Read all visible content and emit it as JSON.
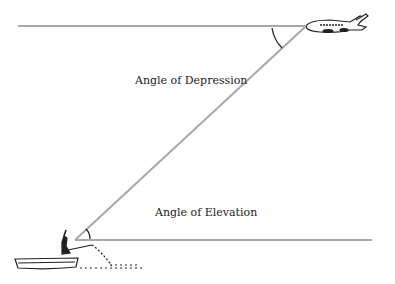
{
  "diagram": {
    "labels": {
      "depression": "Angle of Depression",
      "elevation": "Angle of Elevation"
    },
    "objects": {
      "top": "airplane",
      "bottom": "person in boat"
    },
    "colors": {
      "line": "#a8a8a8",
      "ink": "#222222"
    }
  }
}
